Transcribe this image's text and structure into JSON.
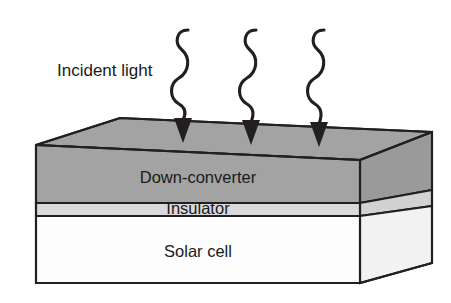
{
  "figure": {
    "type": "layered-stack-diagram"
  },
  "annotations": {
    "incident_light_label": "Incident light"
  },
  "rays": {
    "icon": "wavy-arrow-icon",
    "count": 3,
    "direction": "down",
    "items": [
      {
        "name": "ray-1",
        "x": 182
      },
      {
        "name": "ray-2",
        "x": 250
      },
      {
        "name": "ray-3",
        "x": 318
      }
    ]
  },
  "stack": {
    "layers": [
      {
        "id": "down-converter",
        "label": "Down-converter",
        "fill": "#a3a3a3"
      },
      {
        "id": "insulator",
        "label": "Insulator",
        "fill": "#d9d9d9"
      },
      {
        "id": "solar-cell",
        "label": "Solar cell",
        "fill": "#fdfdfd"
      }
    ],
    "top_face_fill": "#a3a3a3",
    "side_face_fill": "#9a9a9a",
    "side_insulator_fill": "#d2d2d2",
    "side_solarcell_fill": "#f2f2f2"
  },
  "colors": {
    "background": "#ffffff",
    "outline": "#231f20",
    "text": "#1a1a1a"
  }
}
